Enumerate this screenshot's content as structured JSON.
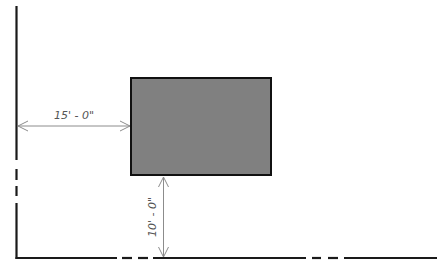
{
  "diagram": {
    "type": "site plan dimension drawing",
    "colors": {
      "wall": "#1a1a1a",
      "building_fill": "#808080",
      "building_stroke": "#111111",
      "dimension": "#8c8c8c",
      "dimension_text": "#555555"
    },
    "building": {
      "x": 131,
      "y": 78,
      "width": 140,
      "height": 97
    },
    "dimensions": {
      "horizontal": {
        "label": "15' - 0\"",
        "from": "left property line",
        "to": "building left edge"
      },
      "vertical": {
        "label": "10' - 0\"",
        "from": "building bottom edge",
        "to": "bottom property line"
      }
    }
  }
}
